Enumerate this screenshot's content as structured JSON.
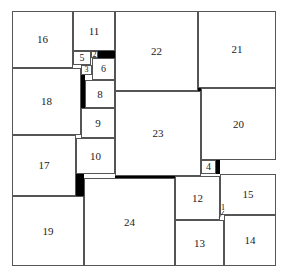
{
  "diagram": {
    "squares": [
      {
        "label": "16",
        "x": 12,
        "y": 11,
        "w": 61,
        "h": 57
      },
      {
        "label": "11",
        "x": 73,
        "y": 11,
        "w": 42,
        "h": 40
      },
      {
        "label": "22",
        "x": 115,
        "y": 11,
        "w": 83,
        "h": 80
      },
      {
        "label": "21",
        "x": 198,
        "y": 11,
        "w": 78,
        "h": 77
      },
      {
        "label": "5",
        "x": 73,
        "y": 51,
        "w": 18,
        "h": 14
      },
      {
        "label": "2",
        "x": 91,
        "y": 51,
        "w": 7,
        "h": 7
      },
      {
        "label": "6",
        "x": 92,
        "y": 58,
        "w": 23,
        "h": 22
      },
      {
        "label": "3",
        "x": 81,
        "y": 65,
        "w": 11,
        "h": 10
      },
      {
        "label": "18",
        "x": 12,
        "y": 68,
        "w": 69,
        "h": 67
      },
      {
        "label": "8",
        "x": 85,
        "y": 80,
        "w": 30,
        "h": 28
      },
      {
        "label": "9",
        "x": 81,
        "y": 108,
        "w": 34,
        "h": 30
      },
      {
        "label": "23",
        "x": 115,
        "y": 91,
        "w": 86,
        "h": 85
      },
      {
        "label": "20",
        "x": 201,
        "y": 88,
        "w": 75,
        "h": 72
      },
      {
        "label": "4",
        "x": 201,
        "y": 160,
        "w": 15,
        "h": 14
      },
      {
        "label": "17",
        "x": 12,
        "y": 135,
        "w": 64,
        "h": 61
      },
      {
        "label": "10",
        "x": 76,
        "y": 138,
        "w": 39,
        "h": 36
      },
      {
        "label": "12",
        "x": 175,
        "y": 176,
        "w": 45,
        "h": 44
      },
      {
        "label": "15",
        "x": 220,
        "y": 174,
        "w": 56,
        "h": 41
      },
      {
        "label": "19",
        "x": 12,
        "y": 196,
        "w": 72,
        "h": 70
      },
      {
        "label": "24",
        "x": 84,
        "y": 178,
        "w": 91,
        "h": 88
      },
      {
        "label": "13",
        "x": 175,
        "y": 220,
        "w": 49,
        "h": 46
      },
      {
        "label": "14",
        "x": 224,
        "y": 215,
        "w": 52,
        "h": 51
      }
    ],
    "gaps": [
      {
        "x": 98,
        "y": 51,
        "w": 17,
        "h": 7
      },
      {
        "x": 81,
        "y": 75,
        "w": 4,
        "h": 33
      },
      {
        "x": 198,
        "y": 88,
        "w": 3,
        "h": 3
      },
      {
        "x": 216,
        "y": 160,
        "w": 4,
        "h": 14
      },
      {
        "x": 76,
        "y": 174,
        "w": 8,
        "h": 22
      },
      {
        "x": 115,
        "y": 174,
        "w": 60,
        "h": 4
      }
    ],
    "annotation_1": {
      "label": "1"
    }
  }
}
